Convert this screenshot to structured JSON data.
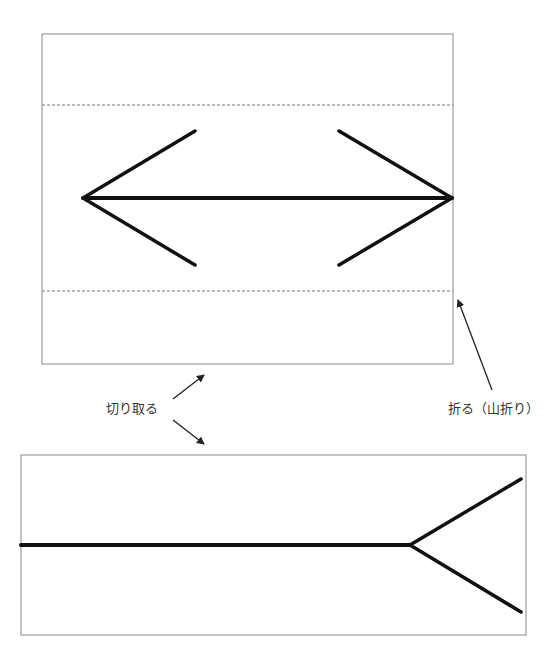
{
  "labels": {
    "cut": "切り取る",
    "fold": "折る（山折り）"
  },
  "colors": {
    "background": "#ffffff",
    "box_border": "#888888",
    "fold_line": "#777777",
    "figure_stroke": "#111111",
    "annotation_arrow": "#222222",
    "label_text": "#333333"
  },
  "top_panel": {
    "box": {
      "x": 42,
      "y": 34,
      "width": 411,
      "height": 330
    },
    "fold_lines_y": [
      105,
      291
    ],
    "figure": "double-headed arrow (Müller-Lyer, inward-pointing heads)",
    "shaft": {
      "x1": 83,
      "y1": 198,
      "x2": 452,
      "y2": 198
    },
    "left_head": [
      [
        195,
        131
      ],
      [
        83,
        198
      ],
      [
        195,
        265
      ]
    ],
    "right_head": [
      [
        339,
        131
      ],
      [
        452,
        198
      ],
      [
        339,
        265
      ]
    ]
  },
  "bottom_panel": {
    "box": {
      "x": 21,
      "y": 455,
      "width": 505,
      "height": 180
    },
    "figure": "line with outward fork (Müller-Lyer tail)",
    "shaft": {
      "x1": 21,
      "y1": 545,
      "x2": 410,
      "y2": 545
    },
    "fork": [
      [
        521,
        479
      ],
      [
        410,
        545
      ],
      [
        521,
        612
      ]
    ]
  },
  "annotations": {
    "cut_arrows": [
      {
        "from": [
          173,
          399
        ],
        "to": [
          205,
          374
        ]
      },
      {
        "from": [
          173,
          420
        ],
        "to": [
          205,
          445
        ]
      }
    ],
    "fold_arrow": {
      "from": [
        492,
        390
      ],
      "to": [
        457,
        298
      ]
    }
  }
}
